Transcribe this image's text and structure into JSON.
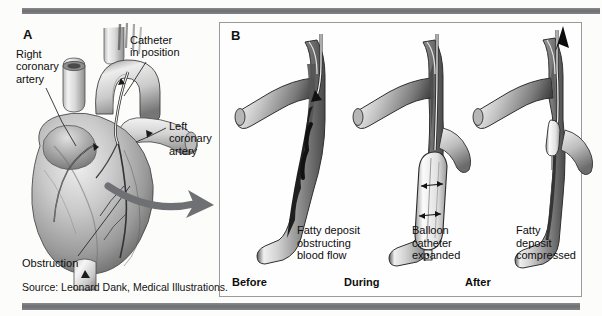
{
  "figure": {
    "panels": [
      {
        "letter": "A",
        "name": "heart-overview"
      },
      {
        "letter": "B",
        "name": "angioplasty-sequence"
      }
    ],
    "source": "Source: Leonard Dank, Medical Illustrations."
  },
  "panel_a": {
    "letter": "A",
    "labels": [
      {
        "id": "right-coronary-artery",
        "text": "Right\ncoronary\nartery"
      },
      {
        "id": "catheter-in-position",
        "text": "Catheter\nin position"
      },
      {
        "id": "left-coronary-artery",
        "text": "Left\ncoronary\nartery"
      },
      {
        "id": "obstruction",
        "text": "Obstruction"
      }
    ]
  },
  "panel_b": {
    "letter": "B",
    "stages": [
      {
        "id": "before",
        "caption": "Before",
        "description": "Fatty deposit\nobstructing\nblood flow"
      },
      {
        "id": "during",
        "caption": "During",
        "description": "Balloon\ncatheter\nexpanded"
      },
      {
        "id": "after",
        "caption": "After",
        "description": "Fatty\ndeposit\ncompressed"
      }
    ]
  },
  "colors": {
    "rule": "#76777a",
    "frame": "#9a9a9a",
    "text": "#0d0d0d",
    "arrow": "#6f7073",
    "artwork_dark": "#3c3c3c",
    "artwork_mid": "#9b9b9b",
    "artwork_light": "#e8e8e8",
    "background": "#fcfcfa"
  }
}
